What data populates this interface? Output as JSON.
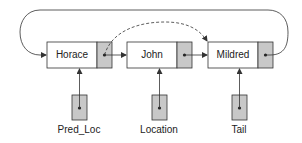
{
  "diagram": {
    "type": "linked-list",
    "nodes": [
      {
        "id": "horace",
        "label": "Horace"
      },
      {
        "id": "john",
        "label": "John"
      },
      {
        "id": "mildred",
        "label": "Mildred"
      }
    ],
    "pointers": [
      {
        "id": "pred_loc",
        "label": "Pred_Loc",
        "points_to": "horace"
      },
      {
        "id": "location",
        "label": "Location",
        "points_to": "john"
      },
      {
        "id": "tail",
        "label": "Tail",
        "points_to": "mildred"
      }
    ],
    "edges": [
      {
        "from": "horace",
        "to": "john",
        "style": "solid"
      },
      {
        "from": "john",
        "to": "mildred",
        "style": "solid"
      },
      {
        "from": "mildred",
        "to": "horace",
        "style": "solid",
        "shape": "loop-over-top"
      },
      {
        "from": "horace",
        "to": "mildred",
        "style": "dashed"
      }
    ],
    "colors": {
      "line": "#333333",
      "node_fill": "#ffffff",
      "pointer_cell_fill": "#c8c8c8"
    }
  }
}
